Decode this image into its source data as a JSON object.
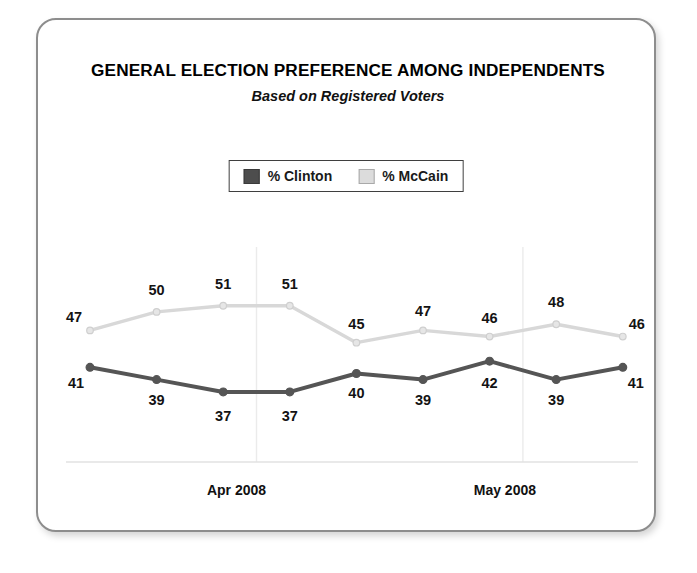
{
  "chart_data": {
    "type": "line",
    "title": "GENERAL ELECTION PREFERENCE AMONG INDEPENDENTS",
    "subtitle": "Based on Registered Voters",
    "xlabel": "",
    "ylabel": "",
    "grid": "vertical-separators-only",
    "legend_position": "top-center",
    "categories": [
      "",
      "",
      "",
      "",
      "",
      "",
      "",
      "",
      ""
    ],
    "xtick_labels": [
      "Apr 2008",
      "May 2008"
    ],
    "series": [
      {
        "name": "% Clinton",
        "color": "#555555",
        "values": [
          41,
          39,
          37,
          37,
          40,
          39,
          42,
          39,
          41
        ]
      },
      {
        "name": "% McCain",
        "color": "#d8d8d8",
        "values": [
          47,
          50,
          51,
          51,
          45,
          47,
          46,
          48,
          46
        ]
      }
    ],
    "ylim": [
      30,
      56
    ]
  },
  "legend": {
    "items": [
      {
        "label": "% Clinton",
        "swatch": "dark-gray-swatch"
      },
      {
        "label": "% McCain",
        "swatch": "light-gray-swatch"
      }
    ]
  },
  "colors": {
    "clinton_line": "#555555",
    "mccain_line": "#d8d8d8",
    "card_border": "#8d8d8d",
    "axis_line": "#e2e2e2",
    "gridline": "#ebebeb",
    "text": "#111111"
  }
}
